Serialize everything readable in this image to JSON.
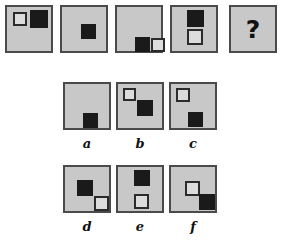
{
  "puzzle": {
    "type": "visual-analogy-matrix",
    "prompt_row": {
      "panels": [
        {
          "id": "stem-1",
          "shapes": [
            {
              "fill": "white",
              "size": 14,
              "x": 6,
              "y": 5
            },
            {
              "fill": "black",
              "size": 18,
              "x": 23,
              "y": 3
            }
          ]
        },
        {
          "id": "stem-2",
          "shapes": [
            {
              "fill": "black",
              "size": 15,
              "x": 19,
              "y": 17
            }
          ]
        },
        {
          "id": "stem-3",
          "shapes": [
            {
              "fill": "black",
              "size": 15,
              "x": 18,
              "y": 30
            },
            {
              "fill": "white",
              "size": 14,
              "x": 34,
              "y": 31
            }
          ]
        },
        {
          "id": "stem-4",
          "shapes": [
            {
              "fill": "black",
              "size": 17,
              "x": 15,
              "y": 3
            },
            {
              "fill": "white",
              "size": 16,
              "x": 15,
              "y": 22
            }
          ]
        },
        {
          "id": "stem-answer",
          "shapes": [],
          "glyph": "?"
        }
      ]
    },
    "options": [
      {
        "id": "option-a",
        "label": "a",
        "shapes": [
          {
            "fill": "black",
            "size": 15,
            "x": 18,
            "y": 29
          }
        ]
      },
      {
        "id": "option-b",
        "label": "b",
        "shapes": [
          {
            "fill": "white",
            "size": 13,
            "x": 5,
            "y": 4
          },
          {
            "fill": "black",
            "size": 16,
            "x": 19,
            "y": 16
          }
        ]
      },
      {
        "id": "option-c",
        "label": "c",
        "shapes": [
          {
            "fill": "white",
            "size": 14,
            "x": 5,
            "y": 4
          },
          {
            "fill": "black",
            "size": 15,
            "x": 17,
            "y": 28
          }
        ]
      },
      {
        "id": "option-d",
        "label": "d",
        "shapes": [
          {
            "fill": "black",
            "size": 16,
            "x": 12,
            "y": 13
          },
          {
            "fill": "white",
            "size": 15,
            "x": 29,
            "y": 29
          }
        ]
      },
      {
        "id": "option-e",
        "label": "e",
        "shapes": [
          {
            "fill": "black",
            "size": 16,
            "x": 16,
            "y": 3
          },
          {
            "fill": "white",
            "size": 15,
            "x": 16,
            "y": 27
          }
        ]
      },
      {
        "id": "option-f",
        "label": "f",
        "shapes": [
          {
            "fill": "white",
            "size": 15,
            "x": 14,
            "y": 14
          },
          {
            "fill": "black",
            "size": 16,
            "x": 28,
            "y": 27
          }
        ]
      }
    ],
    "colors": {
      "panel_fill": "#c8c8c8",
      "panel_border": "#4a4a4a",
      "square_black": "#1a1a1a",
      "square_white_fill": "#dcdcdc",
      "square_white_border": "#2b2b2b",
      "page_background": "#ffffff",
      "text": "#111111"
    },
    "geometry": {
      "stem_panels": [
        {
          "x": 5,
          "y": 5,
          "w": 48,
          "h": 48
        },
        {
          "x": 60,
          "y": 5,
          "w": 48,
          "h": 48
        },
        {
          "x": 115,
          "y": 5,
          "w": 48,
          "h": 48
        },
        {
          "x": 170,
          "y": 5,
          "w": 48,
          "h": 48
        },
        {
          "x": 229,
          "y": 5,
          "w": 48,
          "h": 48
        }
      ],
      "option_panels": [
        {
          "x": 63,
          "y": 82,
          "w": 48,
          "h": 48
        },
        {
          "x": 116,
          "y": 82,
          "w": 48,
          "h": 48
        },
        {
          "x": 169,
          "y": 82,
          "w": 48,
          "h": 48
        },
        {
          "x": 63,
          "y": 165,
          "w": 48,
          "h": 48
        },
        {
          "x": 116,
          "y": 165,
          "w": 48,
          "h": 48
        },
        {
          "x": 169,
          "y": 165,
          "w": 48,
          "h": 48
        }
      ],
      "option_label_y": [
        136,
        219
      ]
    }
  }
}
